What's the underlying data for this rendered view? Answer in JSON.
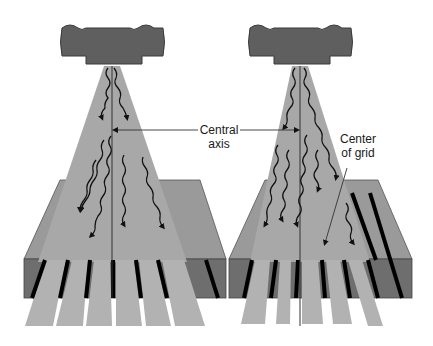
{
  "figure": {
    "panels": [
      {
        "id": "left",
        "label": "grid centered on central axis",
        "central_axis_x": 112
      },
      {
        "id": "right",
        "label": "grid off-center / lateral decentering",
        "central_axis_x": 300
      }
    ]
  },
  "labels": {
    "central_axis_line1": "Central",
    "central_axis_line2": "axis",
    "center_grid_line1": "Center",
    "center_grid_line2": "of grid"
  },
  "colors": {
    "tube": "#5f5f5f",
    "tube_outline": "#3a3a3a",
    "beam": "#a8a8a8",
    "grid_top": "#9a9a9a",
    "grid_front": "#6e6e6e",
    "lead_strip": "#000000",
    "transmitted": "#b2b2b2",
    "line": "#333333"
  }
}
